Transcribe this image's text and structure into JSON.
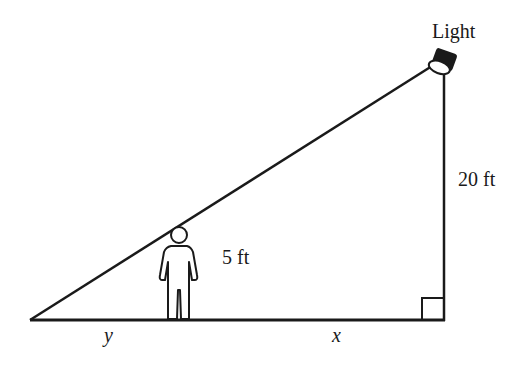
{
  "diagram": {
    "type": "similar-triangles-shadow",
    "labels": {
      "light": "Light",
      "light_height": "20 ft",
      "person_height": "5 ft",
      "shadow_length": "y",
      "distance_to_light": "x"
    },
    "colors": {
      "stroke": "#1a1a1a",
      "background": "#ffffff"
    }
  }
}
